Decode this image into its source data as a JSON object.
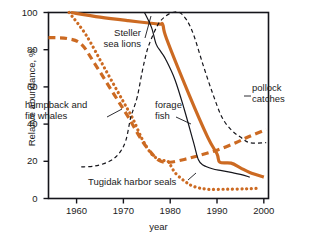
{
  "chart_data": {
    "type": "line",
    "title": "",
    "subtitle": "",
    "xlabel": "year",
    "ylabel": "Relative abundance, %",
    "xlim": [
      1954,
      2001
    ],
    "ylim": [
      0,
      100
    ],
    "grid": false,
    "legend_position": "inline-annotations",
    "xticks": [
      "1960",
      "1970",
      "1980",
      "1990",
      "2000"
    ],
    "xtick_values": [
      1960,
      1970,
      1980,
      1990,
      2000
    ],
    "yticks": [
      "0",
      "20",
      "40",
      "60",
      "80",
      "100"
    ],
    "ytick_values": [
      0,
      20,
      40,
      60,
      80,
      100
    ],
    "colors": {
      "orange": "#cc6a22",
      "black": "#15151b",
      "axis": "#15151b",
      "background": "#ffffff"
    },
    "series": [
      {
        "name": "Steller sea lions",
        "color": "#cc6a22",
        "style": "solid",
        "width": 3.2,
        "points": [
          [
            1958.8,
            100
          ],
          [
            1965,
            97.5
          ],
          [
            1971,
            95.6
          ],
          [
            1977.4,
            93.8
          ],
          [
            1978.4,
            93.5
          ],
          [
            1979.2,
            86
          ],
          [
            1984,
            56
          ],
          [
            1988,
            33
          ],
          [
            1990,
            24
          ],
          [
            1990.6,
            19.5
          ],
          [
            1993,
            19
          ],
          [
            1995,
            16.5
          ],
          [
            1997,
            14
          ],
          [
            2000,
            11.5
          ]
        ]
      },
      {
        "name": "Tugidak harbor seals",
        "color": "#cc6a22",
        "style": "dotted",
        "width": 3.2,
        "points": [
          [
            1958.4,
            100
          ],
          [
            1962,
            88
          ],
          [
            1966,
            70
          ],
          [
            1970,
            52
          ],
          [
            1972,
            43
          ],
          [
            1974,
            32
          ],
          [
            1976,
            24
          ],
          [
            1978,
            20.5
          ],
          [
            1979.5,
            20
          ],
          [
            1981,
            14
          ],
          [
            1983,
            9.5
          ],
          [
            1985,
            6.5
          ],
          [
            1988,
            5
          ],
          [
            1992,
            5
          ],
          [
            1996,
            5.2
          ],
          [
            1998.5,
            5.5
          ]
        ]
      },
      {
        "name": "humpback and fin whales",
        "color": "#cc6a22",
        "style": "dashed",
        "width": 3.2,
        "points": [
          [
            1954,
            86.5
          ],
          [
            1958,
            86
          ],
          [
            1961,
            83
          ],
          [
            1964,
            72
          ],
          [
            1968,
            56
          ],
          [
            1971,
            44
          ],
          [
            1974,
            31
          ],
          [
            1976.5,
            23
          ],
          [
            1978,
            20
          ],
          [
            1980,
            19.5
          ],
          [
            1983,
            21
          ],
          [
            1986,
            23
          ],
          [
            1990,
            26
          ],
          [
            1994,
            30
          ],
          [
            1997,
            33.5
          ],
          [
            2000.5,
            37
          ]
        ]
      },
      {
        "name": "forage fish",
        "color": "#15151b",
        "style": "solid",
        "width": 1.2,
        "points": [
          [
            1974.5,
            100
          ],
          [
            1976,
            92
          ],
          [
            1977,
            83
          ],
          [
            1978,
            79
          ],
          [
            1979,
            75
          ],
          [
            1981,
            64
          ],
          [
            1983,
            48
          ],
          [
            1985,
            30
          ],
          [
            1986,
            21
          ],
          [
            1987,
            18
          ],
          [
            1989,
            16
          ],
          [
            1991,
            15
          ],
          [
            1993,
            14
          ],
          [
            1995,
            13
          ],
          [
            1997,
            11.5
          ]
        ]
      },
      {
        "name": "pollock catches",
        "color": "#15151b",
        "style": "dashed",
        "width": 1.2,
        "points": [
          [
            1961,
            17
          ],
          [
            1964,
            17.5
          ],
          [
            1967,
            20
          ],
          [
            1969,
            24
          ],
          [
            1970.5,
            31
          ],
          [
            1971.5,
            43
          ],
          [
            1972,
            47
          ],
          [
            1973,
            55
          ],
          [
            1974,
            68
          ],
          [
            1975,
            79
          ],
          [
            1976,
            86
          ],
          [
            1977.5,
            94
          ],
          [
            1979,
            98
          ],
          [
            1980.5,
            100
          ],
          [
            1982,
            100
          ],
          [
            1983.5,
            96
          ],
          [
            1985,
            88
          ],
          [
            1987,
            72
          ],
          [
            1989,
            57
          ],
          [
            1991,
            44
          ],
          [
            1993,
            37
          ],
          [
            1995,
            33
          ],
          [
            1997,
            30
          ],
          [
            2000.5,
            30
          ]
        ]
      }
    ],
    "annotations": [
      {
        "name": "steller-sea-lions-label",
        "lines": [
          "Steller",
          "sea lions"
        ],
        "x": 141,
        "y": 27,
        "align": "right",
        "leader": [
          [
            145,
            38
          ],
          [
            151,
            16
          ]
        ]
      },
      {
        "name": "humpback-fin-whales-label",
        "lines": [
          "humpback and",
          "fin whales"
        ],
        "x": 25,
        "y": 99,
        "align": "left",
        "leader": [
          [
            107,
            117
          ],
          [
            122,
            109
          ]
        ]
      },
      {
        "name": "forage-fish-label",
        "lines": [
          "forage",
          "fish"
        ],
        "x": 155,
        "y": 99,
        "align": "left",
        "leader": [
          [
            176,
            117
          ],
          [
            191,
            124
          ]
        ]
      },
      {
        "name": "pollock-catches-label",
        "lines": [
          "pollock",
          "catches"
        ],
        "x": 252,
        "y": 82,
        "align": "left",
        "leader": [
          [
            244,
            96
          ],
          [
            251,
            96
          ]
        ]
      },
      {
        "name": "tugidak-harbor-seals-label",
        "lines": [
          "Tugidak harbor seals"
        ],
        "x": 88,
        "y": 176,
        "align": "left",
        "leader": [
          [
            188,
            180
          ],
          [
            196,
            173
          ]
        ]
      }
    ]
  },
  "axes": {
    "x_title": "year",
    "y_title": "Relative abundance, %"
  }
}
